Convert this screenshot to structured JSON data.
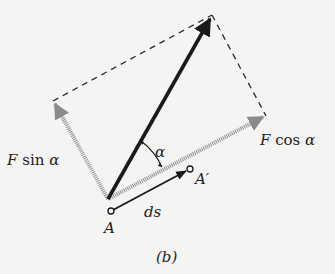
{
  "figure": {
    "caption": "(b)",
    "labels": {
      "f_sin": {
        "F": "F",
        "rest": " sin ",
        "alpha": "α"
      },
      "f_cos": {
        "F": "F",
        "rest": " cos ",
        "alpha": "α"
      },
      "alpha": "α",
      "point_a": "A",
      "point_a_prime": "A′",
      "ds": "ds"
    },
    "colors": {
      "force_vector": "#1a1a1a",
      "component_vectors": "#8a8a8a",
      "dashed_lines": "#2a2a2a",
      "background": "#f4f4f2"
    },
    "geometry": {
      "origin": [
        108,
        199
      ],
      "force_tip": [
        212,
        15
      ],
      "sin_component_tip": [
        53,
        101
      ],
      "cos_component_tip": [
        266,
        116
      ],
      "point_a": [
        111,
        211
      ],
      "point_a_prime": [
        190,
        169
      ]
    }
  }
}
